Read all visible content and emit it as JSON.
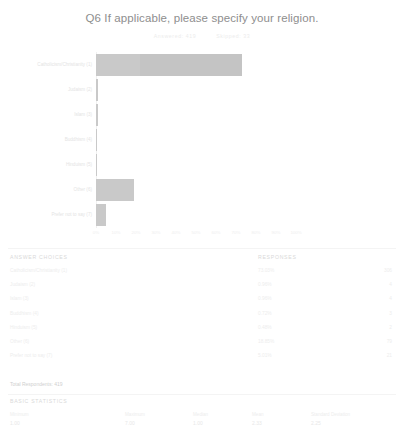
{
  "header": {
    "title": "Q6 If applicable, please specify your religion.",
    "answered_label": "Answered: 419",
    "skipped_label": "Skipped: 33"
  },
  "chart_data": {
    "type": "bar",
    "orientation": "horizontal",
    "title": "Q6 If applicable, please specify your religion.",
    "xlabel": "",
    "ylabel": "",
    "xlim": [
      0,
      100
    ],
    "grid": false,
    "bar_color": "#c9c9c9",
    "categories": [
      "Catholicism/Christianity (1)",
      "Judaism (2)",
      "Islam (3)",
      "Buddhism (4)",
      "Hinduism (5)",
      "Other (6)",
      "Prefer not to say (7)"
    ],
    "values": [
      73.03,
      0.96,
      0.96,
      0.72,
      0.48,
      18.85,
      5.01
    ],
    "counts": [
      306,
      4,
      4,
      3,
      2,
      79,
      21
    ],
    "xticks": [
      "0%",
      "10%",
      "20%",
      "30%",
      "40%",
      "50%",
      "60%",
      "70%",
      "80%",
      "90%",
      "100%"
    ]
  },
  "table": {
    "col_choices": "ANSWER CHOICES",
    "col_responses": "RESPONSES",
    "rows": [
      {
        "label": "Catholicism/Christianity (1)",
        "percent": "73.03%",
        "count": "306"
      },
      {
        "label": "Judaism (2)",
        "percent": "0.96%",
        "count": "4"
      },
      {
        "label": "Islam (3)",
        "percent": "0.96%",
        "count": "4"
      },
      {
        "label": "Buddhism (4)",
        "percent": "0.72%",
        "count": "3"
      },
      {
        "label": "Hinduism (5)",
        "percent": "0.48%",
        "count": "2"
      },
      {
        "label": "Other (6)",
        "percent": "18.85%",
        "count": "79"
      },
      {
        "label": "Prefer not to say (7)",
        "percent": "5.01%",
        "count": "21"
      }
    ],
    "total_respondents": "Total Respondents: 419"
  },
  "statistics": {
    "title": "BASIC STATISTICS",
    "items": [
      {
        "label": "Minimum",
        "value": "1.00"
      },
      {
        "label": "Maximum",
        "value": "7.00"
      },
      {
        "label": "Median",
        "value": "1.00"
      },
      {
        "label": "Mean",
        "value": "2.33"
      },
      {
        "label": "Standard Deviation",
        "value": "2.25"
      }
    ]
  }
}
